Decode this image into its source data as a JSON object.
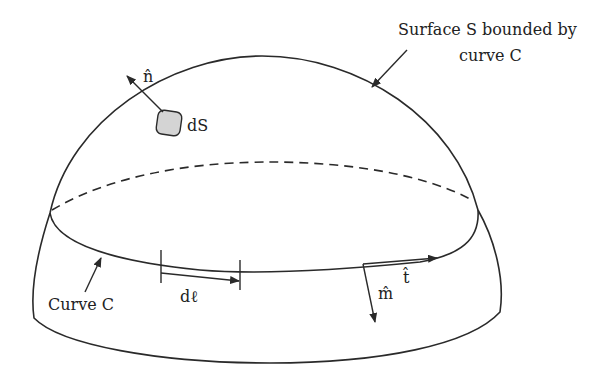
{
  "diagram": {
    "type": "surface-with-boundary-curve",
    "labels": {
      "surface_callout_line1": "Surface S bounded by",
      "surface_callout_line2": "curve C",
      "curve_callout": "Curve C",
      "normal_vector": "n̂",
      "surface_element": "dS",
      "line_element": "dℓ",
      "tangent_vector": "t̂",
      "outward_normal_in_surface": "m̂"
    },
    "colors": {
      "stroke": "#2a2a2a",
      "patch_fill": "#d4d4d4",
      "background": "#ffffff"
    }
  }
}
